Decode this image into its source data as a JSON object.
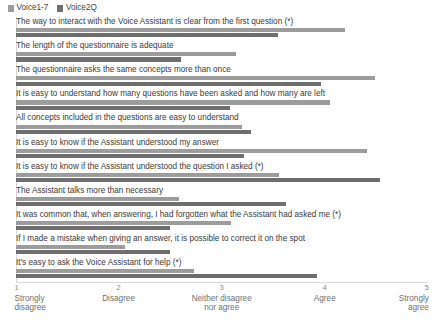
{
  "legend": {
    "position": "top-left",
    "entries": [
      {
        "label": "Voice1-7",
        "color": "#9c9c9c",
        "swatch_name": "legend-swatch-voice1-7"
      },
      {
        "label": "Voice2Q",
        "color": "#6e6e6e",
        "swatch_name": "legend-swatch-voice2q"
      }
    ]
  },
  "axis": {
    "ticks": [
      {
        "num": "1",
        "caption_line1": "Strongly",
        "caption_line2": "disagree"
      },
      {
        "num": "2",
        "caption_line1": "Disagree",
        "caption_line2": ""
      },
      {
        "num": "3",
        "caption_line1": "Neither disagree",
        "caption_line2": "nor agree"
      },
      {
        "num": "4",
        "caption_line1": "Agree",
        "caption_line2": ""
      },
      {
        "num": "5",
        "caption_line1": "Strongly",
        "caption_line2": "agree"
      }
    ]
  },
  "chart_data": {
    "type": "bar",
    "orientation": "horizontal",
    "title": "",
    "xlabel": "",
    "ylabel": "",
    "xlim": [
      1,
      5
    ],
    "grid": false,
    "legend_position": "top-left",
    "tick_labels": [
      "1 Strongly disagree",
      "2 Disagree",
      "3 Neither disagree nor agree",
      "4 Agree",
      "5 Strongly agree"
    ],
    "categories": [
      "The way to interact with the Voice Assistant is clear from the first question (*)",
      "The length of the questionnaire is adequate",
      "The questionnaire asks the same concepts more than once",
      "It is easy to understand how many questions have been asked and how many are left",
      "All concepts included in the questions are easy to understand",
      "It is easy to know if the Assistant understood my answer",
      "It is easy to know if the Assistant understood the question I asked (*)",
      "The Assistant talks more than necessary",
      "It was common that, when answering, I had forgotten what the  Assistant had asked me (*)",
      "If I made a mistake when giving an answer, it is possible to correct it on the spot",
      "It's easy to ask the Voice Assistant for help (*)"
    ],
    "series": [
      {
        "name": "Voice1-7",
        "color": "#9c9c9c",
        "values": [
          4.19,
          3.13,
          4.48,
          4.05,
          3.19,
          4.4,
          3.55,
          2.58,
          3.09,
          2.06,
          2.73
        ]
      },
      {
        "name": "Voice2Q",
        "color": "#6e6e6e",
        "values": [
          3.54,
          2.6,
          3.96,
          3.08,
          3.28,
          3.21,
          4.53,
          3.62,
          2.49,
          2.49,
          3.92
        ]
      }
    ]
  }
}
